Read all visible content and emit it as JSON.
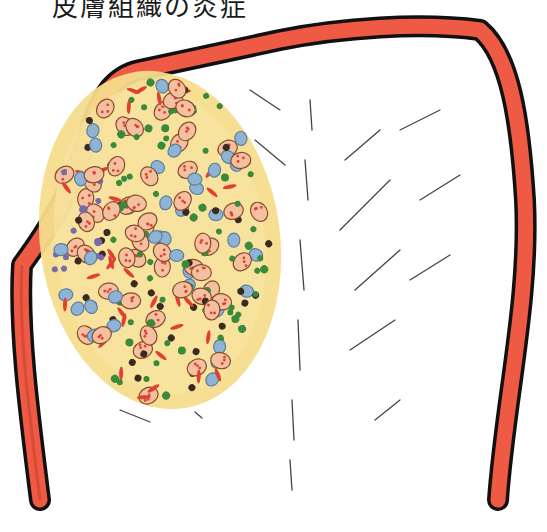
{
  "title": "皮膚組織の炎症",
  "colors": {
    "capsule_fill": "#ee5a44",
    "capsule_outline": "#111111",
    "lesion_fill": "#f5dc8c",
    "lesion_edge": "#f0d070",
    "cell_blue": "#8fb3d4",
    "cell_purple": "#7a6aa8",
    "cell_green": "#3a8a3a",
    "cell_brown": "#8a4a2a",
    "cell_red": "#e04030",
    "fiber_line": "#444444"
  },
  "illustration": {
    "subject": "hand-drawn histology illustration of a dome-shaped structure with red capsule wall and yellow inflammatory cell infiltrate"
  }
}
